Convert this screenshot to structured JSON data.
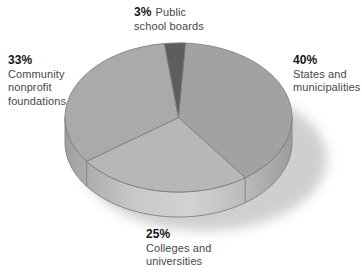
{
  "chart_data": {
    "type": "pie",
    "style": "3d-extruded",
    "title": "",
    "unit": "%",
    "start_angle_deg": 90,
    "direction": "clockwise",
    "background_color": "#ffffff",
    "outline_color": "#7f7f7f",
    "shadow_color": "#9f9f9f",
    "slices": [
      {
        "label": "States and municipalities",
        "value": 40,
        "color": "#a2a2a2"
      },
      {
        "label": "Colleges and universities",
        "value": 25,
        "color": "#b7b7b7"
      },
      {
        "label": "Community nonprofit foundations",
        "value": 33,
        "color": "#aaaaaa"
      },
      {
        "label": "Public school boards",
        "value": 3,
        "color": "#5d5d5d"
      }
    ],
    "rim_colors": [
      "#a0a0a0",
      "#c8c8c8",
      "#d3d3d3",
      "#bcbcbc",
      "#9c9c9c"
    ]
  },
  "labels": {
    "public": {
      "pct": "3%",
      "lines": [
        "Public",
        "school boards"
      ]
    },
    "states": {
      "pct": "40%",
      "lines": [
        "States and",
        "municipalities"
      ]
    },
    "community": {
      "pct": "33%",
      "lines": [
        "Community",
        "nonprofit",
        "foundations"
      ]
    },
    "colleges": {
      "pct": "25%",
      "lines": [
        "Colleges and",
        "universities"
      ]
    }
  }
}
